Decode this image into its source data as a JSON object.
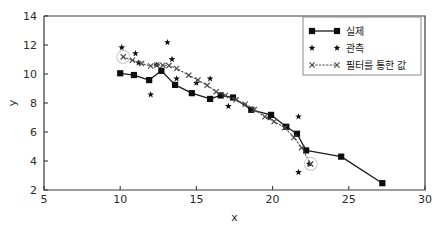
{
  "chart_data": {
    "type": "line",
    "title": "",
    "xlabel": "x",
    "ylabel": "y",
    "xlim": [
      5,
      30
    ],
    "ylim": [
      2,
      14
    ],
    "xticks": [
      5,
      10,
      15,
      20,
      25,
      30
    ],
    "yticks": [
      2,
      4,
      6,
      8,
      10,
      12,
      14
    ],
    "grid": false,
    "legend_position": "upper right",
    "series": [
      {
        "name": "실제",
        "style": "solid line with filled square markers",
        "marker": "square",
        "color": "#0d0d0d",
        "points": [
          [
            10.0,
            10.05
          ],
          [
            10.9,
            9.93
          ],
          [
            11.9,
            9.58
          ],
          [
            12.7,
            10.22
          ],
          [
            13.6,
            9.25
          ],
          [
            14.7,
            8.68
          ],
          [
            15.9,
            8.28
          ],
          [
            16.6,
            8.52
          ],
          [
            17.4,
            8.38
          ],
          [
            18.6,
            7.53
          ],
          [
            19.9,
            7.18
          ],
          [
            20.9,
            6.36
          ],
          [
            21.6,
            5.88
          ],
          [
            22.2,
            4.73
          ],
          [
            24.5,
            4.3
          ],
          [
            27.2,
            2.47
          ]
        ]
      },
      {
        "name": "관측",
        "style": "scatter, star markers",
        "marker": "star",
        "color": "#0d0d0d",
        "points": [
          [
            10.1,
            11.83
          ],
          [
            11.0,
            11.42
          ],
          [
            11.2,
            10.78
          ],
          [
            12.0,
            8.58
          ],
          [
            12.4,
            10.62
          ],
          [
            13.1,
            12.18
          ],
          [
            13.4,
            11.02
          ],
          [
            13.7,
            9.68
          ],
          [
            15.0,
            9.38
          ],
          [
            15.9,
            9.68
          ],
          [
            16.6,
            8.56
          ],
          [
            17.1,
            7.78
          ],
          [
            19.8,
            6.98
          ],
          [
            20.8,
            6.36
          ],
          [
            21.7,
            7.06
          ],
          [
            21.7,
            3.22
          ],
          [
            22.4,
            3.8
          ]
        ]
      },
      {
        "name": "필터를 통한 값",
        "style": "dotted line with x markers",
        "marker": "x",
        "color": "#4a4a4a",
        "points": [
          [
            10.2,
            11.18
          ],
          [
            10.8,
            10.95
          ],
          [
            11.4,
            10.72
          ],
          [
            12.0,
            10.55
          ],
          [
            12.4,
            10.62
          ],
          [
            12.8,
            10.6
          ],
          [
            13.2,
            10.58
          ],
          [
            13.7,
            10.38
          ],
          [
            14.5,
            9.92
          ],
          [
            15.1,
            9.58
          ],
          [
            15.7,
            9.22
          ],
          [
            16.3,
            8.78
          ],
          [
            16.9,
            8.52
          ],
          [
            17.6,
            8.22
          ],
          [
            18.2,
            7.92
          ],
          [
            18.8,
            7.55
          ],
          [
            19.5,
            7.05
          ],
          [
            20.1,
            6.72
          ],
          [
            20.8,
            6.3
          ],
          [
            21.4,
            5.62
          ],
          [
            21.9,
            4.92
          ],
          [
            22.5,
            3.8
          ]
        ]
      }
    ],
    "annotations": [
      {
        "name": "first-filter-halo",
        "x": 10.2,
        "y": 11.18
      },
      {
        "name": "last-filter-halo",
        "x": 22.5,
        "y": 3.8
      }
    ]
  },
  "legend": {
    "entries": [
      {
        "label": "실제",
        "marker": "square-line"
      },
      {
        "label": "관측",
        "marker": "star"
      },
      {
        "label": "필터를 통한 값",
        "marker": "x-dotted"
      }
    ]
  },
  "axes": {
    "xlabel": "x",
    "ylabel": "y",
    "xtick_labels": [
      "5",
      "10",
      "15",
      "20",
      "25",
      "30"
    ],
    "ytick_labels": [
      "2",
      "4",
      "6",
      "8",
      "10",
      "12",
      "14"
    ]
  },
  "colors": {
    "background": "#ffffff",
    "foreground": "#1a1a1a",
    "axis": "#3a3a3a",
    "filter": "#4a4a4a",
    "halo": "#cfcfcf"
  }
}
